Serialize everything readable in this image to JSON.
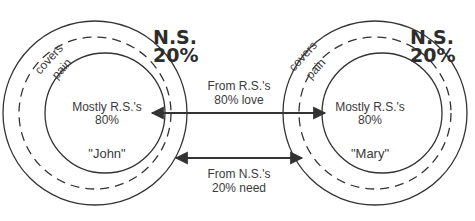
{
  "diagram": {
    "left_person": {
      "name": "\"John\"",
      "core_label": "Mostly R.S.'s",
      "core_pct": "80%",
      "shell_label_1": "covers",
      "shell_label_2": "pain",
      "ns_label": "N.S.",
      "ns_pct": "20%"
    },
    "right_person": {
      "name": "\"Mary\"",
      "core_label": "Mostly R.S.'s",
      "core_pct": "80%",
      "shell_label_1": "covers",
      "shell_label_2": "pain",
      "ns_label": "N.S.",
      "ns_pct": "20%"
    },
    "connections": [
      {
        "label_1": "From R.S.'s",
        "label_2": "80% love",
        "direction": "bidirectional",
        "level": "core"
      },
      {
        "label_1": "From N.S.'s",
        "label_2": "20% need",
        "direction": "bidirectional",
        "level": "shell"
      }
    ],
    "colors": {
      "stroke": "#333333",
      "text": "#3a3a3a",
      "background": "#ffffff"
    }
  }
}
